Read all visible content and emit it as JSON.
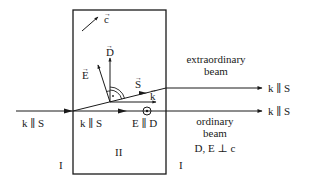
{
  "diagram": {
    "regions": {
      "left": "I",
      "middle": "II",
      "right": "I"
    },
    "vectors": {
      "c": "c",
      "D": "D",
      "E": "E",
      "S": "S",
      "k": "k"
    },
    "labels": {
      "incident": "k ∥ S",
      "inside_ordinary": "k ∥ S",
      "e_parallel_d": "E ∥ D",
      "extraordinary_out": "k ∥ S",
      "ordinary_out": "k ∥ S",
      "extraordinary_beam_line1": "extraordinary",
      "extraordinary_beam_line2": "beam",
      "ordinary_beam_line1": "ordinary",
      "ordinary_beam_line2": "beam",
      "ordinary_condition": "D, E ⊥ c"
    },
    "colors": {
      "ink": "#1a1a1a",
      "background": "#ffffff"
    }
  }
}
